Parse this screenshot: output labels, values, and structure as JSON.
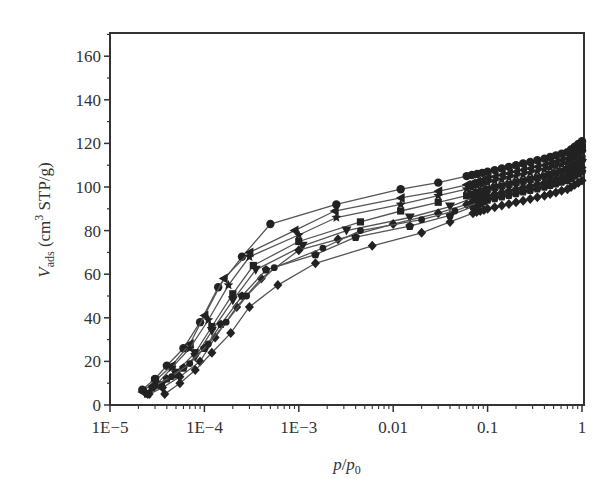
{
  "chart_data": {
    "type": "line",
    "title": "",
    "xlabel": "p/p0",
    "ylabel": "V_ads (cm3 STP/g)",
    "xscale": "log",
    "xlim": [
      1e-05,
      1
    ],
    "ylim": [
      0,
      170
    ],
    "x_ticks": [
      {
        "value": 1e-05,
        "label": "1E−5"
      },
      {
        "value": 0.0001,
        "label": "1E−4"
      },
      {
        "value": 0.001,
        "label": "1E−3"
      },
      {
        "value": 0.01,
        "label": "0.01"
      },
      {
        "value": 0.1,
        "label": "0.1"
      },
      {
        "value": 1,
        "label": "1"
      }
    ],
    "y_ticks": [
      0,
      20,
      40,
      60,
      80,
      100,
      120,
      140,
      160
    ],
    "grid": false,
    "legend": null,
    "series": [
      {
        "name": "series-1",
        "marker": "circle",
        "x": [
          2.2e-05,
          3e-05,
          4e-05,
          6e-05,
          9e-05,
          0.00014,
          0.00025,
          0.0005,
          0.0025,
          0.012,
          0.03,
          0.06,
          0.1,
          0.2,
          0.4,
          0.7,
          1.0
        ],
        "y": [
          7,
          12,
          18,
          26,
          38,
          54,
          68,
          83,
          92,
          99,
          102,
          105,
          107,
          110,
          113,
          116,
          121
        ]
      },
      {
        "name": "series-2",
        "marker": "triangle-left",
        "x": [
          2.2e-05,
          3e-05,
          4.5e-05,
          7e-05,
          0.0001,
          0.00016,
          0.0003,
          0.0009,
          0.0024,
          0.012,
          0.03,
          0.06,
          0.1,
          0.2,
          0.4,
          0.7,
          1.0
        ],
        "y": [
          6,
          11,
          18,
          28,
          41,
          58,
          70,
          80,
          89,
          95,
          98,
          101,
          104,
          107,
          110,
          113,
          118
        ]
      },
      {
        "name": "series-3",
        "marker": "star",
        "x": [
          2.4e-05,
          3.2e-05,
          4.5e-05,
          7e-05,
          0.00011,
          0.00018,
          0.0003,
          0.001,
          0.0025,
          0.012,
          0.03,
          0.06,
          0.1,
          0.2,
          0.4,
          0.7,
          1.0
        ],
        "y": [
          6,
          10,
          17,
          26,
          39,
          55,
          68,
          78,
          86,
          92,
          96,
          99,
          102,
          105,
          108,
          111,
          116
        ]
      },
      {
        "name": "series-4",
        "marker": "square",
        "x": [
          2.5e-05,
          3.5e-05,
          5e-05,
          8e-05,
          0.00012,
          0.0002,
          0.00033,
          0.001,
          0.0045,
          0.012,
          0.03,
          0.06,
          0.1,
          0.2,
          0.4,
          0.7,
          1.0
        ],
        "y": [
          5,
          9,
          15,
          24,
          36,
          51,
          64,
          75,
          84,
          89,
          93,
          96,
          99,
          102,
          105,
          108,
          113
        ]
      },
      {
        "name": "series-5",
        "marker": "triangle-down",
        "x": [
          2.5e-05,
          3.5e-05,
          5e-05,
          8e-05,
          0.00012,
          0.0002,
          0.00035,
          0.0011,
          0.0032,
          0.015,
          0.04,
          0.07,
          0.1,
          0.2,
          0.4,
          0.7,
          1.0
        ],
        "y": [
          5,
          9,
          14,
          22,
          34,
          48,
          62,
          73,
          80,
          86,
          91,
          95,
          98,
          101,
          104,
          107,
          111
        ]
      },
      {
        "name": "series-6",
        "marker": "diamond",
        "x": [
          2.6e-05,
          3.6e-05,
          5.5e-05,
          9e-05,
          0.00013,
          0.00022,
          0.0004,
          0.001,
          0.0026,
          0.01,
          0.03,
          0.06,
          0.1,
          0.2,
          0.4,
          0.7,
          1.0
        ],
        "y": [
          5,
          8,
          13,
          20,
          31,
          45,
          58,
          71,
          76,
          83,
          88,
          92,
          96,
          99,
          102,
          105,
          109
        ]
      },
      {
        "name": "series-7",
        "marker": "pentagon",
        "x": [
          2.8e-05,
          4e-05,
          6e-05,
          0.0001,
          0.00015,
          0.00025,
          0.00045,
          0.0015,
          0.004,
          0.015,
          0.04,
          0.07,
          0.1,
          0.2,
          0.4,
          0.7,
          1.0
        ],
        "y": [
          8,
          12,
          17,
          26,
          37,
          50,
          62,
          69,
          77,
          82,
          87,
          91,
          94,
          97,
          100,
          103,
          107
        ]
      },
      {
        "name": "series-8",
        "marker": "circle-small",
        "x": [
          3e-05,
          4.5e-05,
          7e-05,
          0.00011,
          0.00017,
          0.00028,
          0.00055,
          0.0018,
          0.0045,
          0.02,
          0.045,
          0.08,
          0.1,
          0.2,
          0.4,
          0.7,
          1.0
        ],
        "y": [
          9,
          13,
          19,
          28,
          38,
          50,
          63,
          72,
          80,
          85,
          89,
          93,
          95,
          98,
          101,
          104,
          107
        ]
      },
      {
        "name": "series-9",
        "marker": "diamond",
        "x": [
          3.8e-05,
          5.5e-05,
          8e-05,
          0.00012,
          0.00019,
          0.0003,
          0.0006,
          0.0015,
          0.006,
          0.02,
          0.04,
          0.07,
          0.1,
          0.2,
          0.4,
          0.7,
          1.0
        ],
        "y": [
          5,
          10,
          16,
          24,
          33,
          45,
          55,
          65,
          73,
          79,
          84,
          88,
          90,
          93,
          96,
          99,
          103
        ]
      }
    ]
  },
  "axes": {
    "x_title_main": "p",
    "x_title_sep": "/",
    "x_title_p": "p",
    "x_title_sub": "0",
    "y_title_V": "V",
    "y_title_sub": "ads",
    "y_title_unit_pre": " (cm",
    "y_title_sup": "3",
    "y_title_unit_post": " STP/g)"
  },
  "style": {
    "line_color": "#555555",
    "marker_color": "#222222",
    "axis_color": "#333333"
  }
}
